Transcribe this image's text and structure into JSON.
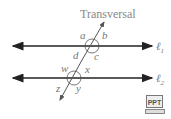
{
  "diagram": {
    "title": "Transversal",
    "line1_label": "ℓ",
    "line1_sub": "1",
    "line2_label": "ℓ",
    "line2_sub": "2",
    "angles_top": {
      "a": "a",
      "b": "b",
      "c": "c",
      "d": "d"
    },
    "angles_bottom": {
      "w": "w",
      "x": "x",
      "y": "y",
      "z": "z"
    }
  },
  "ppt_button": {
    "label": "PPT"
  }
}
